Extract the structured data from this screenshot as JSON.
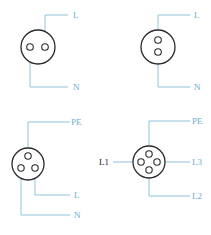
{
  "colors": {
    "wire": "#8fc3dc",
    "label": "#6aaed0",
    "outline": "#2a2a2a"
  },
  "connectors": [
    {
      "id": "two-pin-horizontal",
      "labels": {
        "top": "L",
        "bottom": "N"
      }
    },
    {
      "id": "two-pin-vertical",
      "labels": {
        "top": "L",
        "bottom": "N"
      }
    },
    {
      "id": "three-pin",
      "labels": {
        "top": "PE",
        "middle": "L",
        "bottom": "N"
      }
    },
    {
      "id": "four-pin",
      "labels": {
        "top": "PE",
        "left": "L1",
        "right": "L3",
        "bottom": "L2"
      }
    }
  ]
}
